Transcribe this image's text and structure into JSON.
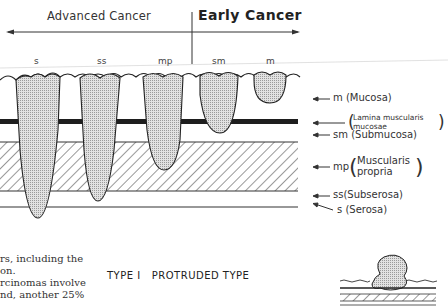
{
  "header": {
    "advanced_label": "Advanced Cancer",
    "early_label": "Early Cancer"
  },
  "columns": [
    {
      "label": "s"
    },
    {
      "label": "ss"
    },
    {
      "label": "mp"
    },
    {
      "label": "sm"
    },
    {
      "label": "m"
    }
  ],
  "layers": [
    {
      "abbr": "m",
      "name": "(Mucosa)"
    },
    {
      "abbr": "",
      "name_line1": "Lamina muscularis",
      "name_line2": "mucosae"
    },
    {
      "abbr": "sm",
      "name": "(Submucosa)"
    },
    {
      "abbr": "mp",
      "name_line1": "Muscularis",
      "name_line2": "propria"
    },
    {
      "abbr": "ss",
      "name": "(Subserosa)"
    },
    {
      "abbr": "s",
      "name": "(Serosa)"
    }
  ],
  "body_text": {
    "line1": "rs, including the",
    "line2": "on.",
    "line3": "rcinomas involve",
    "line4": "nd, another 25%"
  },
  "type_label": {
    "roman": "TYPE I",
    "name": "PROTRUDED TYPE"
  },
  "colors": {
    "ink": "#222222",
    "tumor_fill": "#d4d4d4",
    "background": "#ffffff"
  }
}
